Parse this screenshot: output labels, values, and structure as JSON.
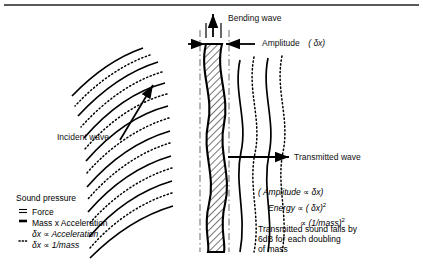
{
  "figure": {
    "title_rule": "top-rule",
    "labels": {
      "bending_wave": "Bending wave",
      "amplitude": "Amplitude",
      "amplitude_value": "( δx)",
      "incident_wave": "Incident wave",
      "transmitted_wave": "Transmitted wave"
    },
    "equations": {
      "line1": "( Amplitude  ∝  δx)",
      "line2_lead": "Energy  ∝ ( δx)",
      "line2_exp": "2",
      "line3_lead": "∝ (1/mass)",
      "line3_exp": "2"
    },
    "note": {
      "line1": "Transmitted sound falls by",
      "line2": "6dB for each doubling",
      "line3": "of mass"
    },
    "legend": {
      "heading": "Sound pressure",
      "items": [
        {
          "key": "double-line-key",
          "text": "Force"
        },
        {
          "key": "thick-line-key",
          "text": "Mass x Acceleration"
        },
        {
          "key": "none",
          "text": "δx ∝  Acceleration"
        },
        {
          "key": "dotted-line-key",
          "text": "δx ∝  1/mass"
        }
      ]
    },
    "colors": {
      "ink": "#000000",
      "hatch": "#555555",
      "rule": "#222222"
    }
  }
}
